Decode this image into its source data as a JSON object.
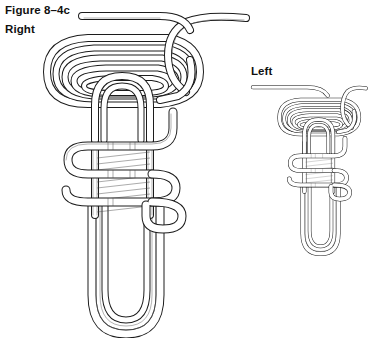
{
  "figure": {
    "number_label": "Figure 8–4c",
    "right_label": "Right",
    "left_label": "Left",
    "background_color": "#ffffff",
    "line_color": "#1c1c1c",
    "core_line_color": "#6b6b6b",
    "hatch_color": "#4a4a4a"
  },
  "diagrams": [
    {
      "name": "right-knot",
      "label": "Right",
      "scale": 1.0,
      "bounds": {
        "x": 40,
        "y": 10,
        "width": 210,
        "height": 325
      },
      "parts": [
        {
          "name": "upper-coil-loops",
          "count": 5,
          "shape": "concentric-horizontal-ovals"
        },
        {
          "name": "running-end-tail",
          "direction": "upper-right"
        },
        {
          "name": "standing-end-tail",
          "direction": "upper-left"
        },
        {
          "name": "serpentine-weave",
          "turns": 3
        },
        {
          "name": "vertical-core-strands",
          "count": 6
        },
        {
          "name": "bottom-bight",
          "shape": "long-u-loop",
          "strands": 4
        }
      ]
    },
    {
      "name": "left-knot",
      "label": "Left",
      "scale": 0.52,
      "bounds": {
        "x": 255,
        "y": 80,
        "width": 105,
        "height": 175
      },
      "parts": [
        {
          "name": "upper-coil-loops",
          "count": 5,
          "shape": "concentric-horizontal-ovals"
        },
        {
          "name": "running-end-tail",
          "direction": "upper-right"
        },
        {
          "name": "standing-end-tail",
          "direction": "upper-left"
        },
        {
          "name": "serpentine-weave",
          "turns": 3
        },
        {
          "name": "vertical-core-strands",
          "count": 6
        },
        {
          "name": "bottom-bight",
          "shape": "long-u-loop",
          "strands": 4
        }
      ]
    }
  ]
}
